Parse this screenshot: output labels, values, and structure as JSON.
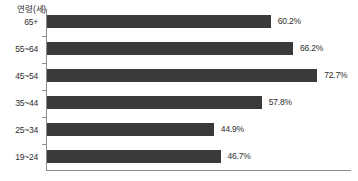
{
  "chart_data": {
    "type": "bar",
    "orientation": "horizontal",
    "title": "",
    "subtitle": "",
    "xlabel": "",
    "ylabel": "연령(세)",
    "axis_title": "연령(세)",
    "categories": [
      "65+",
      "55~64",
      "45~54",
      "35~44",
      "25~34",
      "19~24"
    ],
    "values": [
      60.2,
      66.2,
      72.7,
      57.8,
      44.9,
      46.7
    ],
    "value_labels": [
      "60.2%",
      "66.2%",
      "72.7%",
      "57.8%",
      "44.9%",
      "46.7%"
    ],
    "xlim": [
      0,
      81.8
    ],
    "grid": false,
    "legend": null,
    "bar_color": "#3a3a3a",
    "axis_color": "#8d8d8d",
    "text_color": "#2e2e2e",
    "background": "#ffffff",
    "series": [
      {
        "name": "",
        "values": [
          60.2,
          66.2,
          72.7,
          57.8,
          44.9,
          46.7
        ]
      }
    ]
  }
}
